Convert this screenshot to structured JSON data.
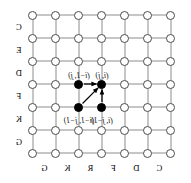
{
  "figure": {
    "type": "lattice-dependency-diagram",
    "mirrored": true,
    "grid": {
      "rows": 7,
      "cols": 7,
      "origin_x": 20,
      "origin_y": 15,
      "spacing": 23,
      "node_stroke": "#4d4d4d",
      "edge_stroke": "#8c8c8c",
      "node_fill": "#ffffff",
      "highlight_fill": "#000000"
    },
    "highlighted_nodes": [
      {
        "name": "cell-i-j",
        "col": 3,
        "row": 3
      },
      {
        "name": "cell-im1-j",
        "col": 4,
        "row": 3
      },
      {
        "name": "cell-i-jm1",
        "col": 3,
        "row": 4
      },
      {
        "name": "cell-im1-jm1",
        "col": 4,
        "row": 4
      }
    ],
    "arrows": [
      {
        "name": "arrow-from-im1-j",
        "from_col": 4,
        "from_row": 3,
        "to_col": 3,
        "to_row": 3
      },
      {
        "name": "arrow-from-i-jm1",
        "from_col": 3,
        "from_row": 4,
        "to_col": 3,
        "to_row": 3
      },
      {
        "name": "arrow-from-im1-jm1",
        "from_col": 4,
        "from_row": 4,
        "to_col": 3,
        "to_row": 3
      }
    ],
    "labels": [
      {
        "name": "label-i-j",
        "text": "(i, j)",
        "col": 3,
        "row": 3,
        "dy": -9,
        "align": "center"
      },
      {
        "name": "label-im1-j",
        "text": "(i−1, j)",
        "col": 4,
        "row": 3,
        "dy": -9,
        "align": "center"
      },
      {
        "name": "label-i-jm1",
        "text": "(i, j−1)",
        "col": 3,
        "row": 4,
        "dy": 13,
        "align": "center"
      },
      {
        "name": "label-im1-jm1",
        "text": "(i−1, j−1)",
        "col": 4,
        "row": 4,
        "dy": 13,
        "align": "center"
      }
    ],
    "right_axis_letters": [
      {
        "name": "right-axis-letter-0",
        "text": "C",
        "row": 0
      },
      {
        "name": "right-axis-letter-1",
        "text": "E",
        "row": 1
      },
      {
        "name": "right-axis-letter-2",
        "text": "D",
        "row": 2
      },
      {
        "name": "right-axis-letter-3",
        "text": "F",
        "row": 3
      },
      {
        "name": "right-axis-letter-4",
        "text": "K",
        "row": 4
      },
      {
        "name": "right-axis-letter-5",
        "text": "G",
        "row": 5
      }
    ],
    "bottom_axis_letters": [
      {
        "name": "bottom-axis-letter-0",
        "text": "C",
        "col": 1
      },
      {
        "name": "bottom-axis-letter-1",
        "text": "D",
        "col": 2
      },
      {
        "name": "bottom-axis-letter-2",
        "text": "F",
        "col": 3
      },
      {
        "name": "bottom-axis-letter-3",
        "text": "R",
        "col": 4
      },
      {
        "name": "bottom-axis-letter-4",
        "text": "K",
        "col": 5
      },
      {
        "name": "bottom-axis-letter-5",
        "text": "G",
        "col": 6
      }
    ]
  }
}
